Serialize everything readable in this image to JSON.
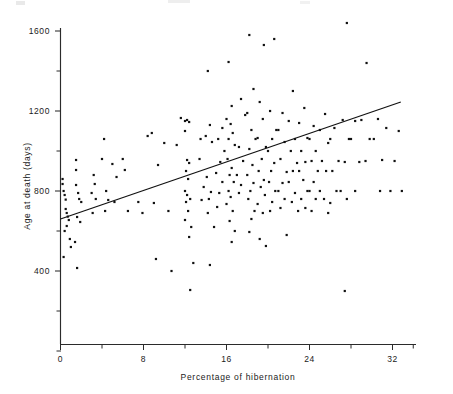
{
  "figure": {
    "title": "",
    "background": "#ffffff",
    "ink_color": "#111111"
  },
  "axes": {
    "y_title": "Age at death (days)",
    "x_title": "Percentage of hibernation",
    "x_ticks": [
      "0",
      "8",
      "16",
      "24",
      "32"
    ],
    "y_ticks": [
      "400",
      "800",
      "1200",
      "1600"
    ]
  },
  "chart_data": {
    "type": "scatter",
    "title": "",
    "xlabel": "Percentage of hibernation",
    "ylabel": "Age at death (days)",
    "xlim": [
      0,
      34
    ],
    "ylim": [
      0,
      1600
    ],
    "xticks": [
      0,
      8,
      16,
      24,
      32
    ],
    "yticks": [
      400,
      800,
      1200,
      1600
    ],
    "x_minor_ticks": [
      4,
      12,
      20,
      28
    ],
    "y_minor_ticks": [
      200,
      600,
      1000,
      1400
    ],
    "grid": false,
    "legend": null,
    "marker": "dot",
    "points": [
      [
        0.2,
        835
      ],
      [
        0.3,
        800
      ],
      [
        0.4,
        780
      ],
      [
        0.5,
        757
      ],
      [
        0.5,
        710
      ],
      [
        0.6,
        690
      ],
      [
        0.7,
        672
      ],
      [
        0.2,
        860
      ],
      [
        0.8,
        655
      ],
      [
        0.6,
        625
      ],
      [
        0.4,
        600
      ],
      [
        0.9,
        560
      ],
      [
        1.0,
        520
      ],
      [
        0.3,
        470
      ],
      [
        1.5,
        955
      ],
      [
        1.5,
        905
      ],
      [
        1.5,
        830
      ],
      [
        1.7,
        790
      ],
      [
        1.8,
        760
      ],
      [
        2.0,
        745
      ],
      [
        1.6,
        670
      ],
      [
        1.9,
        645
      ],
      [
        1.4,
        545
      ],
      [
        1.6,
        415
      ],
      [
        3.2,
        880
      ],
      [
        3.3,
        835
      ],
      [
        3.0,
        790
      ],
      [
        3.4,
        760
      ],
      [
        3.1,
        690
      ],
      [
        4.2,
        1060
      ],
      [
        4.0,
        960
      ],
      [
        4.4,
        800
      ],
      [
        4.6,
        755
      ],
      [
        4.3,
        700
      ],
      [
        5.0,
        935
      ],
      [
        5.4,
        870
      ],
      [
        5.2,
        745
      ],
      [
        6.0,
        960
      ],
      [
        6.2,
        905
      ],
      [
        6.5,
        700
      ],
      [
        7.5,
        745
      ],
      [
        7.9,
        690
      ],
      [
        8.4,
        1075
      ],
      [
        8.8,
        1090
      ],
      [
        9.4,
        930
      ],
      [
        9.0,
        740
      ],
      [
        9.2,
        460
      ],
      [
        10.0,
        1040
      ],
      [
        10.4,
        700
      ],
      [
        10.7,
        400
      ],
      [
        11.6,
        1165
      ],
      [
        11.2,
        1030
      ],
      [
        12.0,
        1150
      ],
      [
        12.2,
        1155
      ],
      [
        12.4,
        1145
      ],
      [
        12.0,
        1100
      ],
      [
        12.2,
        955
      ],
      [
        12.4,
        940
      ],
      [
        12.1,
        900
      ],
      [
        12.3,
        860
      ],
      [
        12.0,
        800
      ],
      [
        12.2,
        780
      ],
      [
        12.5,
        760
      ],
      [
        12.1,
        745
      ],
      [
        12.3,
        700
      ],
      [
        12.0,
        655
      ],
      [
        12.6,
        620
      ],
      [
        12.4,
        570
      ],
      [
        12.8,
        440
      ],
      [
        12.5,
        305
      ],
      [
        13.5,
        1060
      ],
      [
        13.4,
        960
      ],
      [
        13.8,
        820
      ],
      [
        13.6,
        755
      ],
      [
        14.2,
        1400
      ],
      [
        14.4,
        1130
      ],
      [
        14.0,
        1075
      ],
      [
        14.6,
        1045
      ],
      [
        14.1,
        870
      ],
      [
        14.5,
        795
      ],
      [
        14.3,
        760
      ],
      [
        14.2,
        690
      ],
      [
        14.8,
        620
      ],
      [
        14.4,
        430
      ],
      [
        15.6,
        1115
      ],
      [
        15.2,
        1060
      ],
      [
        15.8,
        1000
      ],
      [
        15.4,
        945
      ],
      [
        15.0,
        890
      ],
      [
        15.6,
        845
      ],
      [
        15.3,
        790
      ],
      [
        15.1,
        720
      ],
      [
        16.2,
        1445
      ],
      [
        16.5,
        1225
      ],
      [
        16.0,
        1160
      ],
      [
        16.4,
        1135
      ],
      [
        16.6,
        1090
      ],
      [
        16.2,
        1060
      ],
      [
        16.8,
        1030
      ],
      [
        16.1,
        960
      ],
      [
        16.5,
        915
      ],
      [
        16.3,
        880
      ],
      [
        16.7,
        845
      ],
      [
        16.2,
        800
      ],
      [
        16.4,
        770
      ],
      [
        16.0,
        735
      ],
      [
        16.6,
        700
      ],
      [
        16.3,
        650
      ],
      [
        16.8,
        600
      ],
      [
        16.5,
        545
      ],
      [
        17.4,
        1260
      ],
      [
        17.8,
        1180
      ],
      [
        17.2,
        1020
      ],
      [
        17.6,
        950
      ],
      [
        17.0,
        880
      ],
      [
        17.4,
        830
      ],
      [
        17.2,
        790
      ],
      [
        18.2,
        1580
      ],
      [
        18.6,
        1310
      ],
      [
        18.0,
        1190
      ],
      [
        18.4,
        1105
      ],
      [
        18.8,
        1060
      ],
      [
        18.2,
        1010
      ],
      [
        18.5,
        930
      ],
      [
        18.0,
        880
      ],
      [
        18.6,
        840
      ],
      [
        18.3,
        800
      ],
      [
        18.1,
        760
      ],
      [
        18.7,
        700
      ],
      [
        18.4,
        660
      ],
      [
        18.2,
        595
      ],
      [
        19.6,
        1530
      ],
      [
        19.2,
        1245
      ],
      [
        19.5,
        1160
      ],
      [
        19.0,
        1065
      ],
      [
        19.8,
        1020
      ],
      [
        19.4,
        960
      ],
      [
        19.1,
        900
      ],
      [
        19.6,
        855
      ],
      [
        19.3,
        820
      ],
      [
        19.7,
        780
      ],
      [
        19.0,
        735
      ],
      [
        19.5,
        690
      ],
      [
        19.2,
        560
      ],
      [
        19.8,
        525
      ],
      [
        20.6,
        1560
      ],
      [
        20.2,
        1200
      ],
      [
        20.8,
        1105
      ],
      [
        20.4,
        1060
      ],
      [
        20.0,
        1000
      ],
      [
        20.6,
        940
      ],
      [
        20.3,
        900
      ],
      [
        20.1,
        845
      ],
      [
        20.7,
        800
      ],
      [
        20.4,
        745
      ],
      [
        20.2,
        700
      ],
      [
        21.4,
        1190
      ],
      [
        21.0,
        1105
      ],
      [
        21.6,
        1045
      ],
      [
        21.2,
        960
      ],
      [
        21.8,
        895
      ],
      [
        21.4,
        840
      ],
      [
        21.0,
        800
      ],
      [
        21.6,
        760
      ],
      [
        21.2,
        715
      ],
      [
        21.8,
        580
      ],
      [
        22.4,
        1300
      ],
      [
        22.0,
        1150
      ],
      [
        22.6,
        1060
      ],
      [
        22.2,
        1000
      ],
      [
        22.8,
        940
      ],
      [
        22.4,
        900
      ],
      [
        22.0,
        845
      ],
      [
        22.6,
        790
      ],
      [
        22.3,
        745
      ],
      [
        22.9,
        700
      ],
      [
        23.5,
        1215
      ],
      [
        23.0,
        1140
      ],
      [
        23.8,
        1065
      ],
      [
        23.2,
        1000
      ],
      [
        23.6,
        945
      ],
      [
        23.0,
        900
      ],
      [
        23.4,
        855
      ],
      [
        23.8,
        800
      ],
      [
        23.2,
        760
      ],
      [
        23.6,
        715
      ],
      [
        24.4,
        1125
      ],
      [
        24.0,
        1060
      ],
      [
        24.6,
        1000
      ],
      [
        24.2,
        950
      ],
      [
        24.8,
        900
      ],
      [
        24.4,
        845
      ],
      [
        24.0,
        800
      ],
      [
        24.6,
        760
      ],
      [
        24.2,
        700
      ],
      [
        25.5,
        1185
      ],
      [
        25.0,
        1105
      ],
      [
        25.8,
        1040
      ],
      [
        25.2,
        950
      ],
      [
        25.6,
        900
      ],
      [
        25.0,
        800
      ],
      [
        25.4,
        760
      ],
      [
        25.8,
        690
      ],
      [
        26.4,
        1115
      ],
      [
        26.0,
        1060
      ],
      [
        26.8,
        950
      ],
      [
        26.2,
        900
      ],
      [
        26.6,
        800
      ],
      [
        26.0,
        740
      ],
      [
        27.6,
        1640
      ],
      [
        27.2,
        1155
      ],
      [
        27.8,
        1060
      ],
      [
        27.4,
        945
      ],
      [
        27.0,
        800
      ],
      [
        27.6,
        760
      ],
      [
        27.4,
        300
      ],
      [
        28.4,
        1150
      ],
      [
        28.0,
        1060
      ],
      [
        28.8,
        945
      ],
      [
        28.4,
        800
      ],
      [
        29.5,
        1440
      ],
      [
        29.0,
        1155
      ],
      [
        29.8,
        1060
      ],
      [
        29.4,
        950
      ],
      [
        30.6,
        1160
      ],
      [
        30.2,
        1060
      ],
      [
        30.8,
        800
      ],
      [
        31.4,
        1115
      ],
      [
        31.0,
        955
      ],
      [
        31.8,
        800
      ],
      [
        32.6,
        1100
      ],
      [
        32.2,
        950
      ],
      [
        32.9,
        800
      ]
    ],
    "fit_line": {
      "label": "regression line",
      "x_start": 0,
      "y_start": 660,
      "x_end": 32.8,
      "y_end": 1245
    }
  }
}
